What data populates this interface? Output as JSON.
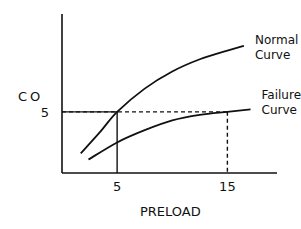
{
  "chart_data": {
    "type": "line",
    "title": "",
    "xlabel": "PRELOAD",
    "ylabel": "CO",
    "xlim": [
      0,
      19.5
    ],
    "ylim": [
      0,
      13
    ],
    "xticks": [
      {
        "value": 5,
        "label": "5"
      },
      {
        "value": 15,
        "label": "15"
      }
    ],
    "yticks": [
      {
        "value": 5,
        "label": "5"
      }
    ],
    "grid": false,
    "series": [
      {
        "name": "Normal Curve",
        "label_lines": [
          "Normal",
          "Curve"
        ],
        "points": [
          [
            1.7,
            1.6
          ],
          [
            3.5,
            3.4
          ],
          [
            5,
            5
          ],
          [
            7.5,
            6.9
          ],
          [
            10,
            8.3
          ],
          [
            12.5,
            9.3
          ],
          [
            15,
            10.0
          ],
          [
            16.5,
            10.4
          ]
        ]
      },
      {
        "name": "Failure Curve",
        "label_lines": [
          "Failure",
          "Curve"
        ],
        "points": [
          [
            2.4,
            1.1
          ],
          [
            5,
            2.5
          ],
          [
            7.5,
            3.5
          ],
          [
            10,
            4.3
          ],
          [
            12.5,
            4.75
          ],
          [
            15,
            5.0
          ],
          [
            17.1,
            5.2
          ]
        ]
      }
    ],
    "reference_lines": [
      {
        "name": "normal-operating-point",
        "x": 5,
        "y": 5,
        "style": "solid"
      },
      {
        "name": "failure-compensated-point",
        "x": 15,
        "y": 5,
        "style": "dashed"
      }
    ]
  }
}
